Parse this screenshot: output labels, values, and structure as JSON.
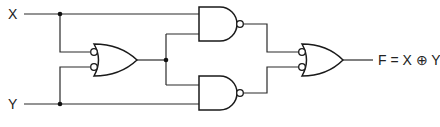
{
  "diagram": {
    "type": "logic-circuit",
    "inputs": [
      {
        "label": "X"
      },
      {
        "label": "Y"
      }
    ],
    "output": {
      "label": "F = X ⊕ Y"
    },
    "gates": [
      {
        "id": "or1",
        "type": "OR",
        "inverted_inputs": true
      },
      {
        "id": "nand1",
        "type": "NAND"
      },
      {
        "id": "nand2",
        "type": "NAND"
      },
      {
        "id": "or2",
        "type": "OR",
        "inverted_inputs": true
      }
    ],
    "colors": {
      "line": "#1a1a1a",
      "background": "#ffffff"
    }
  }
}
